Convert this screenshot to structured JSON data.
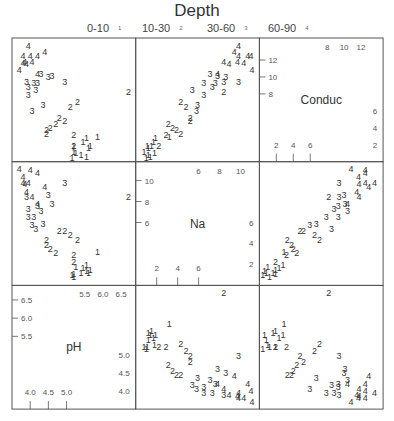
{
  "chart_data": {
    "type": "scatter",
    "subtype": "scatterplot-matrix",
    "title": "Depth",
    "legend": {
      "position": "top",
      "entries": [
        {
          "label": "0-10",
          "symbol": "1"
        },
        {
          "label": "10-30",
          "symbol": "2"
        },
        {
          "label": "30-60",
          "symbol": "3"
        },
        {
          "label": "60-90",
          "symbol": "4"
        }
      ]
    },
    "variables": [
      {
        "name": "pH",
        "range": [
          3.5,
          6.9
        ],
        "ticks_low": [
          "4.0",
          "4.5",
          "5.0"
        ],
        "ticks_low_values": [
          4.0,
          4.5,
          5.0
        ],
        "ticks_high": [
          "5.5",
          "6.0",
          "6.5"
        ],
        "ticks_high_values": [
          5.5,
          6.0,
          6.5
        ]
      },
      {
        "name": "Na",
        "range": [
          0,
          11.8
        ],
        "ticks_low": [
          "2",
          "4",
          "6"
        ],
        "ticks_low_values": [
          2,
          4,
          6
        ],
        "ticks_high": [
          "6",
          "8",
          "10"
        ],
        "ticks_high_values": [
          6,
          8,
          10
        ]
      },
      {
        "name": "Conduc",
        "range": [
          0,
          14.6
        ],
        "ticks_low": [
          "2",
          "4",
          "6"
        ],
        "ticks_low_values": [
          2,
          4,
          6
        ],
        "ticks_high": [
          "8",
          "10",
          "12"
        ],
        "ticks_high_values": [
          8,
          10,
          12
        ]
      }
    ],
    "matrix_order_columns": [
      "pH",
      "Na",
      "Conduc"
    ],
    "matrix_order_rows_top_to_bottom": [
      "Conduc",
      "Na",
      "pH"
    ],
    "grid": false,
    "points": [
      {
        "depth": 1,
        "pH": 5.85,
        "Na": 3.2,
        "Conduc": 2.9
      },
      {
        "depth": 1,
        "pH": 5.55,
        "Na": 1.9,
        "Conduc": 2.8
      },
      {
        "depth": 1,
        "pH": 5.45,
        "Na": 1.7,
        "Conduc": 2.3
      },
      {
        "depth": 1,
        "pH": 5.65,
        "Na": 1.5,
        "Conduc": 1.9
      },
      {
        "depth": 1,
        "pH": 5.6,
        "Na": 1.2,
        "Conduc": 1.6
      },
      {
        "depth": 1,
        "pH": 5.2,
        "Na": 1.1,
        "Conduc": 1.9
      },
      {
        "depth": 1,
        "pH": 5.2,
        "Na": 0.8,
        "Conduc": 1.2
      },
      {
        "depth": 1,
        "pH": 5.4,
        "Na": 1.2,
        "Conduc": 0.8
      },
      {
        "depth": 1,
        "pH": 5.25,
        "Na": 1.8,
        "Conduc": 1.0
      },
      {
        "depth": 1,
        "pH": 5.55,
        "Na": 1.4,
        "Conduc": 0.6
      },
      {
        "depth": 1,
        "pH": 5.15,
        "Na": 1.0,
        "Conduc": 0.4
      },
      {
        "depth": 2,
        "pH": 6.7,
        "Na": 8.4,
        "Conduc": 8.2
      },
      {
        "depth": 2,
        "pH": 5.3,
        "Na": 4.3,
        "Conduc": 7.1
      },
      {
        "depth": 2,
        "pH": 5.1,
        "Na": 4.8,
        "Conduc": 6.5
      },
      {
        "depth": 2,
        "pH": 4.95,
        "Na": 5.2,
        "Conduc": 4.8
      },
      {
        "depth": 2,
        "pH": 4.8,
        "Na": 5.2,
        "Conduc": 5.2
      },
      {
        "depth": 2,
        "pH": 4.7,
        "Na": 3.1,
        "Conduc": 4.4
      },
      {
        "depth": 2,
        "pH": 4.55,
        "Na": 3.5,
        "Conduc": 4.0
      },
      {
        "depth": 2,
        "pH": 4.45,
        "Na": 3.9,
        "Conduc": 3.8
      },
      {
        "depth": 2,
        "pH": 4.45,
        "Na": 4.3,
        "Conduc": 3.3
      },
      {
        "depth": 2,
        "pH": 5.2,
        "Na": 2.9,
        "Conduc": 3.2
      },
      {
        "depth": 2,
        "pH": 5.2,
        "Na": 2.2,
        "Conduc": 1.9
      },
      {
        "depth": 3,
        "pH": 4.95,
        "Na": 9.8,
        "Conduc": 9.4
      },
      {
        "depth": 3,
        "pH": 4.35,
        "Na": 5.9,
        "Conduc": 6.7
      },
      {
        "depth": 3,
        "pH": 4.6,
        "Na": 7.8,
        "Conduc": 10.1
      },
      {
        "depth": 3,
        "pH": 4.3,
        "Na": 7.1,
        "Conduc": 10.4
      },
      {
        "depth": 3,
        "pH": 4.5,
        "Na": 8.6,
        "Conduc": 10.0
      },
      {
        "depth": 3,
        "pH": 4.15,
        "Na": 5.4,
        "Conduc": 8.5
      },
      {
        "depth": 3,
        "pH": 4.1,
        "Na": 6.5,
        "Conduc": 9.3
      },
      {
        "depth": 3,
        "pH": 3.95,
        "Na": 6.5,
        "Conduc": 7.9
      },
      {
        "depth": 3,
        "pH": 3.95,
        "Na": 7.3,
        "Conduc": 8.8
      },
      {
        "depth": 3,
        "pH": 3.9,
        "Na": 8.4,
        "Conduc": 9.4
      },
      {
        "depth": 3,
        "pH": 4.05,
        "Na": 5.8,
        "Conduc": 5.95
      },
      {
        "depth": 3,
        "pH": 4.2,
        "Na": 7.6,
        "Conduc": 9.3
      },
      {
        "depth": 4,
        "pH": 4.4,
        "Na": 9.4,
        "Conduc": 12.9
      },
      {
        "depth": 4,
        "pH": 3.9,
        "Na": 8.9,
        "Conduc": 11.5
      },
      {
        "depth": 4,
        "pH": 4.2,
        "Na": 7.8,
        "Conduc": 10.4
      },
      {
        "depth": 4,
        "pH": 4.05,
        "Na": 8.4,
        "Conduc": 11.75
      },
      {
        "depth": 4,
        "pH": 3.95,
        "Na": 9.8,
        "Conduc": 13.6
      },
      {
        "depth": 4,
        "pH": 3.8,
        "Na": 9.8,
        "Conduc": 12.5
      },
      {
        "depth": 4,
        "pH": 3.8,
        "Na": 10.3,
        "Conduc": 11.7
      },
      {
        "depth": 4,
        "pH": 4.2,
        "Na": 10.7,
        "Conduc": 12.5
      },
      {
        "depth": 4,
        "pH": 4.0,
        "Na": 11.0,
        "Conduc": 12.5
      },
      {
        "depth": 4,
        "pH": 3.7,
        "Na": 11.1,
        "Conduc": 10.8
      },
      {
        "depth": 4,
        "pH": 3.85,
        "Na": 9.7,
        "Conduc": 11.75
      }
    ]
  },
  "colors": {
    "background": "#ffffff",
    "panel_border": "#555555",
    "text": "#333333"
  }
}
